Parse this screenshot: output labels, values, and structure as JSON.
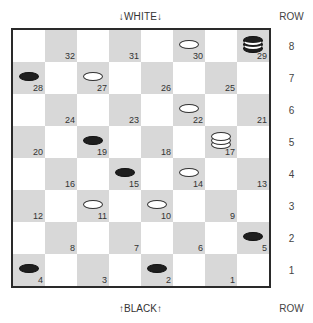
{
  "labels": {
    "top": "↓WHITE↓",
    "bottom": "↑BLACK↑",
    "row_header_top": "ROW",
    "row_header_bottom": "ROW"
  },
  "rows": [
    "8",
    "7",
    "6",
    "5",
    "4",
    "3",
    "2",
    "1"
  ],
  "colors": {
    "dark_square": "#d8d8d8",
    "light_square": "#ffffff",
    "border": "#2a2a2a",
    "white_piece": "#ffffff",
    "black_piece": "#1e1e1e"
  },
  "board": [
    [
      {
        "dark": false
      },
      {
        "dark": true,
        "num": "32"
      },
      {
        "dark": false
      },
      {
        "dark": true,
        "num": "31"
      },
      {
        "dark": false
      },
      {
        "dark": true,
        "num": "30",
        "piece": "white"
      },
      {
        "dark": false
      },
      {
        "dark": true,
        "num": "29",
        "piece": "black",
        "king": true
      }
    ],
    [
      {
        "dark": true,
        "num": "28",
        "piece": "black"
      },
      {
        "dark": false
      },
      {
        "dark": true,
        "num": "27",
        "piece": "white"
      },
      {
        "dark": false
      },
      {
        "dark": true,
        "num": "26"
      },
      {
        "dark": false
      },
      {
        "dark": true,
        "num": "25"
      },
      {
        "dark": false
      }
    ],
    [
      {
        "dark": false
      },
      {
        "dark": true,
        "num": "24"
      },
      {
        "dark": false
      },
      {
        "dark": true,
        "num": "23"
      },
      {
        "dark": false
      },
      {
        "dark": true,
        "num": "22",
        "piece": "white"
      },
      {
        "dark": false
      },
      {
        "dark": true,
        "num": "21"
      }
    ],
    [
      {
        "dark": true,
        "num": "20"
      },
      {
        "dark": false
      },
      {
        "dark": true,
        "num": "19",
        "piece": "black"
      },
      {
        "dark": false
      },
      {
        "dark": true,
        "num": "18"
      },
      {
        "dark": false
      },
      {
        "dark": true,
        "num": "17",
        "piece": "white",
        "king": true
      },
      {
        "dark": false
      }
    ],
    [
      {
        "dark": false
      },
      {
        "dark": true,
        "num": "16"
      },
      {
        "dark": false
      },
      {
        "dark": true,
        "num": "15",
        "piece": "black"
      },
      {
        "dark": false
      },
      {
        "dark": true,
        "num": "14",
        "piece": "white"
      },
      {
        "dark": false
      },
      {
        "dark": true,
        "num": "13"
      }
    ],
    [
      {
        "dark": true,
        "num": "12"
      },
      {
        "dark": false
      },
      {
        "dark": true,
        "num": "11",
        "piece": "white"
      },
      {
        "dark": false
      },
      {
        "dark": true,
        "num": "10",
        "piece": "white"
      },
      {
        "dark": false
      },
      {
        "dark": true,
        "num": "9"
      },
      {
        "dark": false
      }
    ],
    [
      {
        "dark": false
      },
      {
        "dark": true,
        "num": "8"
      },
      {
        "dark": false
      },
      {
        "dark": true,
        "num": "7"
      },
      {
        "dark": false
      },
      {
        "dark": true,
        "num": "6"
      },
      {
        "dark": false
      },
      {
        "dark": true,
        "num": "5",
        "piece": "black"
      }
    ],
    [
      {
        "dark": true,
        "num": "4",
        "piece": "black"
      },
      {
        "dark": false
      },
      {
        "dark": true,
        "num": "3"
      },
      {
        "dark": false
      },
      {
        "dark": true,
        "num": "2",
        "piece": "black"
      },
      {
        "dark": false
      },
      {
        "dark": true,
        "num": "1"
      },
      {
        "dark": false
      }
    ]
  ],
  "pieces": {
    "white": [
      "30",
      "27",
      "22",
      "17",
      "14",
      "11",
      "10"
    ],
    "black": [
      "29",
      "28",
      "19",
      "15",
      "5",
      "4",
      "2"
    ],
    "kings": {
      "white": [
        "17"
      ],
      "black": [
        "29"
      ]
    }
  }
}
